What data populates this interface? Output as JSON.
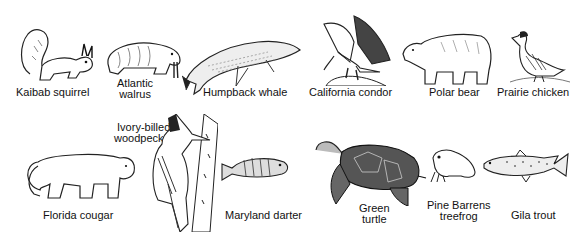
{
  "animals": {
    "kaibab_squirrel": {
      "label": "Kaibab squirrel"
    },
    "atlantic_walrus": {
      "line1": "Atlantic",
      "line2": "walrus"
    },
    "humpback_whale": {
      "label": "Humpback whale"
    },
    "california_condor": {
      "label": "California condor"
    },
    "polar_bear": {
      "label": "Polar bear"
    },
    "prairie_chicken": {
      "label": "Prairie chicken"
    },
    "florida_cougar": {
      "label": "Florida cougar"
    },
    "ivory_billed_woodpecker": {
      "line1": "Ivory-billed",
      "line2": "woodpecker"
    },
    "maryland_darter": {
      "label": "Maryland darter"
    },
    "green_turtle": {
      "line1": "Green",
      "line2": "turtle"
    },
    "pine_barrens_treefrog": {
      "line1": "Pine Barrens",
      "line2": "treefrog"
    },
    "gila_trout": {
      "label": "Gila trout"
    }
  }
}
